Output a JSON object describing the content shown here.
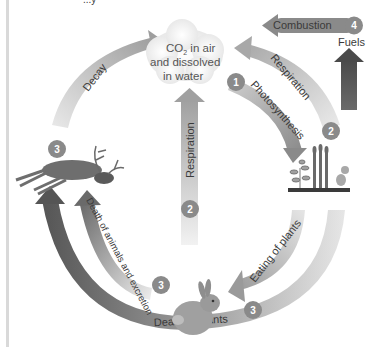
{
  "diagram": {
    "title_fragment": "...y",
    "center_node": {
      "line1": "CO",
      "subscript": "2",
      "line1_rest": " in air",
      "line2": "and dissolved",
      "line3": "in water"
    },
    "fuels_label": "Fuels",
    "arrows": {
      "decay": "Decay",
      "respiration_outer": "Respiration",
      "photosynthesis": "Photosynthesis",
      "respiration_center": "Respiration",
      "combustion": "Combustion",
      "eating_of_plants": "Eating of plants",
      "death_of_plants": "Death of plants",
      "death_of_animals": "Death of animals and excretion"
    },
    "badges": {
      "photosynthesis": "1",
      "respiration_outer": "2",
      "respiration_center": "2",
      "decay": "3",
      "death_of_animals": "3",
      "death_of_plants": "3",
      "combustion": "4"
    },
    "organisms": {
      "animal_top_left": "deer",
      "animal_bottom": "rabbit",
      "plants": "plants"
    },
    "colors": {
      "badge": "#8a8a8a",
      "arrow_dark": "#5f5f5f",
      "arrow_mid": "#9a9a9a",
      "arrow_light": "#d8d8d8",
      "text": "#3a3a3a"
    }
  }
}
